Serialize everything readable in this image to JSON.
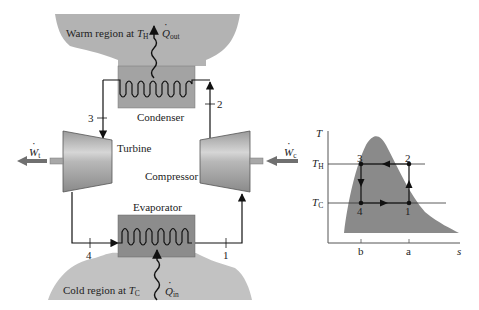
{
  "regions": {
    "warm": {
      "label": "Warm region at ",
      "temp_symbol": "T",
      "temp_sub": "H"
    },
    "cold": {
      "label": "Cold region at ",
      "temp_symbol": "T",
      "temp_sub": "C"
    }
  },
  "heat": {
    "out": {
      "symbol": "Q",
      "sub": "out"
    },
    "in": {
      "symbol": "Q",
      "sub": "in"
    }
  },
  "components": {
    "condenser": "Condenser",
    "evaporator": "Evaporator",
    "turbine": "Turbine",
    "compressor": "Compressor"
  },
  "work": {
    "turbine": {
      "symbol": "W",
      "sub": "t"
    },
    "compressor": {
      "symbol": "W",
      "sub": "c"
    }
  },
  "states": {
    "s1": "1",
    "s2": "2",
    "s3": "3",
    "s4": "4"
  },
  "ts_diagram": {
    "y_axis": "T",
    "x_axis": "s",
    "th": {
      "symbol": "T",
      "sub": "H"
    },
    "tc": {
      "symbol": "T",
      "sub": "C"
    },
    "x_ticks": [
      "b",
      "a"
    ],
    "points": [
      "1",
      "2",
      "3",
      "4"
    ]
  },
  "colors": {
    "region_fill": "#b3b3b3",
    "exchanger_fill": "#8c8c8c",
    "dome_fill": "#8a8a8a",
    "line": "#111111",
    "work_arrow": "#707070"
  }
}
